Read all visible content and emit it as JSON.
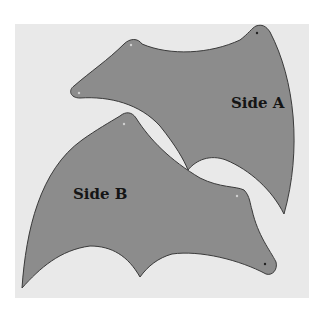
{
  "image": {
    "description": "Photo of two gray cut-out wing template pieces on a light background",
    "background_color": "#e9e9e9",
    "piece_color": "#8c8c8c",
    "outline_color": "#333333"
  },
  "pieces": [
    {
      "label": "Side A"
    },
    {
      "label": "Side B"
    }
  ]
}
